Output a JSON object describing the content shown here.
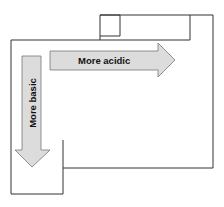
{
  "diagram": {
    "arrows": {
      "horizontal": {
        "label": "More acidic",
        "direction": "right"
      },
      "vertical": {
        "label": "More basic",
        "direction": "down"
      }
    },
    "colors": {
      "outline": "#333333",
      "arrow_fill": "#dcdcdc",
      "arrow_stroke": "#777777",
      "text": "#111111"
    }
  }
}
